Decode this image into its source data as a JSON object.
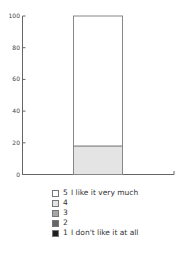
{
  "chart_data": {
    "type": "bar",
    "stacked": true,
    "title": "",
    "xlabel": "",
    "ylabel": "",
    "ylim": [
      0,
      100
    ],
    "yticks": [
      0,
      20,
      40,
      60,
      80,
      100
    ],
    "categories": [
      ""
    ],
    "series": [
      {
        "name": "1 I don't like it at all",
        "values": [
          0
        ],
        "color": "#1e1e1e"
      },
      {
        "name": "2",
        "values": [
          0
        ],
        "color": "#666666"
      },
      {
        "name": "3",
        "values": [
          0
        ],
        "color": "#a6a6a6"
      },
      {
        "name": "4",
        "values": [
          18
        ],
        "color": "#e4e4e4"
      },
      {
        "name": "5 I like it very much",
        "values": [
          82
        ],
        "color": "#ffffff"
      }
    ],
    "legend_position": "bottom",
    "grid": false
  },
  "axis": {
    "ticks": [
      "0",
      "20",
      "40",
      "60",
      "80",
      "100"
    ]
  },
  "legend": {
    "items": [
      {
        "num": "5",
        "text": "I like it very much",
        "color": "#ffffff"
      },
      {
        "num": "4",
        "text": "",
        "color": "#e4e4e4"
      },
      {
        "num": "3",
        "text": "",
        "color": "#a6a6a6"
      },
      {
        "num": "2",
        "text": "",
        "color": "#666666"
      },
      {
        "num": "1",
        "text": "I don't like it at all",
        "color": "#1e1e1e"
      }
    ]
  }
}
